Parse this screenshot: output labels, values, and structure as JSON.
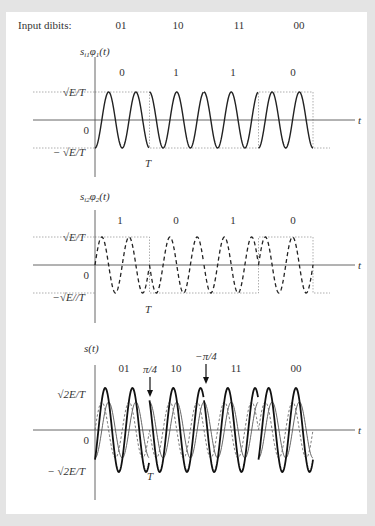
{
  "header": {
    "label": "Input dibits:",
    "dibits": [
      "01",
      "10",
      "11",
      "00"
    ]
  },
  "geometry": {
    "axis_x": 95,
    "end_x": 313,
    "axis_end_x": 355,
    "symbols": 4,
    "cycles_per_symbol": 2
  },
  "panels": [
    {
      "id": "in-phase",
      "title": "s_{i1}φ_1(t)",
      "title_main": "s",
      "title_sub1": "i1",
      "title_mid": "φ",
      "title_sub2": "1",
      "title_tail": "(t)",
      "bits": [
        "0",
        "1",
        "1",
        "0"
      ],
      "signs": [
        1,
        -1,
        -1,
        1
      ],
      "upper_label": "√E/T",
      "lower_label": "− √E/T",
      "zero_label": "0",
      "period_label": "T",
      "axis_label": "t",
      "mid_y": 120,
      "amp": 28,
      "axis_top": 57,
      "axis_bottom": 177,
      "curve_style": "solid"
    },
    {
      "id": "quadrature",
      "title": "s_{i2}φ_2(t)",
      "title_main": "s",
      "title_sub1": "i2",
      "title_mid": "φ",
      "title_sub2": "2",
      "title_tail": "(t)",
      "bits": [
        "1",
        "0",
        "1",
        "0"
      ],
      "signs": [
        1,
        -1,
        -1,
        1
      ],
      "upper_label": "√E/T",
      "lower_label": "−√E//T",
      "zero_label": "0",
      "period_label": "T",
      "axis_label": "t",
      "mid_y": 265,
      "amp": 28,
      "axis_top": 210,
      "axis_bottom": 323,
      "curve_style": "dashed"
    },
    {
      "id": "qpsk-sum",
      "title": "s(t)",
      "bits": [
        "01",
        "10",
        "11",
        "00"
      ],
      "upper_label": "√2E/T",
      "lower_label": "− √2E/T",
      "zero_label": "0",
      "period_label": "T",
      "axis_label": "t",
      "mid_y": 430,
      "amp": 28,
      "axis_top": 365,
      "axis_bottom": 500,
      "annotations": [
        {
          "text": "π/4",
          "x": 150
        },
        {
          "text": "−π/4",
          "x": 206
        }
      ]
    }
  ],
  "colors": {
    "background": "#e4e4e4",
    "panel": "#ffffff",
    "ink": "#222222",
    "guide": "#9a9a9a",
    "axis": "#555555"
  }
}
